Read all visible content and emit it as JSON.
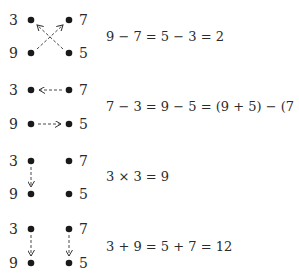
{
  "panels": [
    {
      "id": "cross",
      "labels": {
        "top_left": "3",
        "top_right": "7",
        "bottom_left": "9",
        "bottom_right": "5"
      },
      "arrows": "diagonal crossing: bottom-left to top-right, bottom-right to top-left",
      "equation": "9 − 7 = 5 − 3 = 2"
    },
    {
      "id": "horizontal",
      "labels": {
        "top_left": "3",
        "top_right": "7",
        "bottom_left": "9",
        "bottom_right": "5"
      },
      "arrows": "horizontal: top-right to top-left, bottom-left to bottom-right",
      "equation": "7 − 3 = 9 − 5 = (9 + 5) − (7 + 3) = 4"
    },
    {
      "id": "vertical-single",
      "labels": {
        "top_left": "3",
        "top_right": "7",
        "bottom_left": "9",
        "bottom_right": "5"
      },
      "arrows": "vertical: top-left to bottom-left",
      "equation": "3 × 3 = 9"
    },
    {
      "id": "vertical-double",
      "labels": {
        "top_left": "3",
        "top_right": "7",
        "bottom_left": "9",
        "bottom_right": "5"
      },
      "arrows": "vertical: top-left to bottom-left, top-right to bottom-right",
      "equation": "3 + 9 = 5 + 7 = 12"
    }
  ],
  "colors": {
    "dot": "#1a1a1a",
    "text": "#2a2a2a",
    "arrow": "#333333"
  }
}
